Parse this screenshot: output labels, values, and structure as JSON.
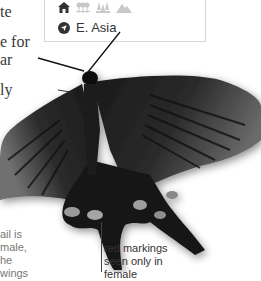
{
  "body_text": {
    "line1_fragment": "te",
    "line2_fragment": "e for",
    "line3_fragment": "ar",
    "line4_fragment": "ly"
  },
  "infobox": {
    "habitat_icons": [
      "home-icon",
      "orchard-icon",
      "forest-icon",
      "mountain-icon"
    ],
    "region_icon": "location-arrow-icon",
    "region": "E. Asia"
  },
  "captions": {
    "left": {
      "line1": "ail is",
      "line2": "male,",
      "line3": "he",
      "line4": "wings"
    },
    "right": {
      "line1": "red markings",
      "line2": "seen only in",
      "line3": "female"
    }
  },
  "colors": {
    "text": "#333333",
    "muted_icon": "#c8c8c8",
    "dark_icon": "#333333",
    "border": "#d6d6d6"
  }
}
